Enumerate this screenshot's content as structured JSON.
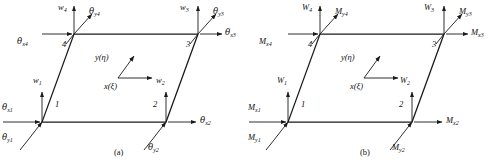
{
  "figure": {
    "type": "finite-element-nodal-dof-and-force-diagram",
    "panels": [
      {
        "id": "a",
        "caption": "(a)",
        "caption_x": 118,
        "caption_y": 148,
        "quantity_kind": "displacements-and-rotations",
        "axes": {
          "y_label": "y(η)",
          "x_label": "x(ξ)"
        },
        "nodes": [
          {
            "number": "1",
            "num_x": 57,
            "num_y": 105,
            "nx": 42,
            "ny": 122,
            "vertical": {
              "label": "w",
              "sub": "1",
              "lx": 33,
              "ly": 82
            },
            "horizontal": {
              "label": "θ",
              "sub": "x1",
              "lx": 2,
              "ly": 108,
              "dir": "right-into-node"
            },
            "diagonal": {
              "label": "θ",
              "sub": "y1",
              "lx": 2,
              "ly": 138,
              "dir": "down-left"
            }
          },
          {
            "number": "2",
            "num_x": 155,
            "num_y": 105,
            "nx": 166,
            "ny": 122,
            "vertical": {
              "label": "w",
              "sub": "2",
              "lx": 156,
              "ly": 82
            },
            "horizontal": {
              "label": "θ",
              "sub": "x2",
              "lx": 198,
              "ly": 114,
              "dir": "right-out-of-node"
            },
            "diagonal": {
              "label": "θ",
              "sub": "y2",
              "lx": 150,
              "ly": 142,
              "dir": "down-left"
            }
          },
          {
            "number": "3",
            "num_x": 188,
            "num_y": 44,
            "nx": 198,
            "ny": 34,
            "vertical": {
              "label": "w",
              "sub": "3",
              "lx": 180,
              "ly": 8
            },
            "horizontal": {
              "label": "θ",
              "sub": "x3",
              "lx": 222,
              "ly": 28,
              "dir": "right-out-of-node"
            },
            "diagonal": {
              "label": "θ",
              "sub": "y3",
              "lx": 212,
              "ly": 8,
              "dir": "up-right"
            }
          },
          {
            "number": "4",
            "num_x": 64,
            "num_y": 44,
            "nx": 74,
            "ny": 34,
            "vertical": {
              "label": "w",
              "sub": "4",
              "lx": 58,
              "ly": 5
            },
            "horizontal": {
              "label": "θ",
              "sub": "x4",
              "lx": 20,
              "ly": 38,
              "dir": "right-into-node"
            },
            "diagonal": {
              "label": "θ",
              "sub": "y4",
              "lx": 88,
              "ly": 10,
              "dir": "up-right"
            }
          }
        ]
      },
      {
        "id": "b",
        "caption": "(b)",
        "caption_x": 118,
        "caption_y": 148,
        "quantity_kind": "forces-and-moments",
        "axes": {
          "y_label": "y(η)",
          "x_label": "x(ξ)"
        },
        "nodes": [
          {
            "number": "1",
            "num_x": 57,
            "num_y": 105,
            "nx": 42,
            "ny": 122,
            "vertical": {
              "label": "W",
              "sub": "1",
              "lx": 31,
              "ly": 82
            },
            "horizontal": {
              "label": "M",
              "sub": "x1",
              "lx": 2,
              "ly": 108,
              "dir": "right-into-node"
            },
            "diagonal": {
              "label": "M",
              "sub": "y1",
              "lx": 2,
              "ly": 138,
              "dir": "down-left"
            }
          },
          {
            "number": "2",
            "num_x": 155,
            "num_y": 105,
            "nx": 166,
            "ny": 122,
            "vertical": {
              "label": "W",
              "sub": "2",
              "lx": 154,
              "ly": 82
            },
            "horizontal": {
              "label": "M",
              "sub": "x2",
              "lx": 198,
              "ly": 114,
              "dir": "right-out-of-node"
            },
            "diagonal": {
              "label": "M",
              "sub": "y2",
              "lx": 148,
              "ly": 142,
              "dir": "down-left"
            }
          },
          {
            "number": "3",
            "num_x": 188,
            "num_y": 44,
            "nx": 198,
            "ny": 34,
            "vertical": {
              "label": "W",
              "sub": "3",
              "lx": 178,
              "ly": 8
            },
            "horizontal": {
              "label": "M",
              "sub": "x3",
              "lx": 222,
              "ly": 28,
              "dir": "right-out-of-node"
            },
            "diagonal": {
              "label": "M",
              "sub": "y3",
              "lx": 212,
              "ly": 8,
              "dir": "up-right"
            }
          },
          {
            "number": "4",
            "num_x": 64,
            "num_y": 44,
            "nx": 74,
            "ny": 34,
            "vertical": {
              "label": "W",
              "sub": "4",
              "lx": 56,
              "ly": 5
            },
            "horizontal": {
              "label": "M",
              "sub": "x4",
              "lx": 16,
              "ly": 38,
              "dir": "right-into-node"
            },
            "diagonal": {
              "label": "M",
              "sub": "y4",
              "lx": 88,
              "ly": 10,
              "dir": "up-right"
            }
          }
        ]
      }
    ],
    "geometry": {
      "n1": [
        42,
        122
      ],
      "n2": [
        166,
        122
      ],
      "n3": [
        198,
        34
      ],
      "n4": [
        74,
        34
      ],
      "axis_origin": [
        118,
        78
      ],
      "axis_x_tip": [
        152,
        78
      ],
      "axis_y_tip": [
        134,
        56
      ]
    },
    "colors": {
      "background": "#ffffff",
      "line": "#1a1a1a",
      "text": "#111111"
    }
  }
}
